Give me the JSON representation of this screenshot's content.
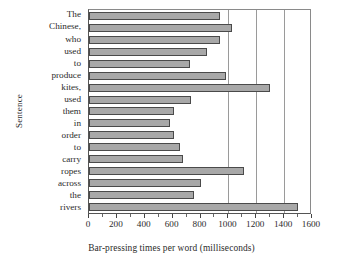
{
  "chart_data": {
    "type": "bar",
    "orientation": "horizontal",
    "title": "",
    "xlabel": "Bar-pressing times per word (milliseconds)",
    "ylabel": "Sentence",
    "xlim": [
      0,
      1600
    ],
    "xticks": [
      0,
      200,
      400,
      600,
      800,
      1000,
      1200,
      1400,
      1600
    ],
    "xtick_labels": [
      "0",
      "200",
      "400",
      "600",
      "800",
      "1000",
      "1200",
      "1400",
      "1600"
    ],
    "minor_tick_step": 100,
    "grid": "vertical gridlines at 1000, 1200, 1400",
    "gridlines": [
      1000,
      1200,
      1400
    ],
    "legend": null,
    "bar_color": "#a8a8a8",
    "bar_edge_color": "#4a4a4a",
    "categories": [
      "The",
      "Chinese,",
      "who",
      "used",
      "to",
      "produce",
      "kites,",
      "used",
      "them",
      "in",
      "order",
      "to",
      "carry",
      "ropes",
      "across",
      "the",
      "rivers"
    ],
    "values": [
      940,
      1025,
      940,
      850,
      725,
      980,
      1300,
      730,
      610,
      580,
      610,
      655,
      675,
      1110,
      800,
      750,
      1500
    ]
  }
}
